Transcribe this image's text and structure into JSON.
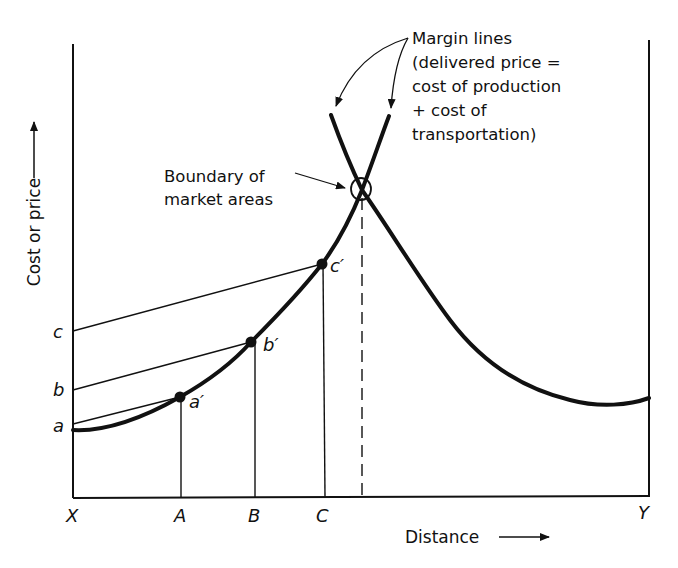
{
  "diagram": {
    "y_axis_label": "Cost or price",
    "x_axis_label": "Distance",
    "x_points": {
      "left_market": "X",
      "right_market": "Y",
      "A": "A",
      "B": "B",
      "C": "C"
    },
    "y_points": {
      "a": "a",
      "b": "b",
      "c": "c"
    },
    "curve_points": {
      "a_prime": "a′",
      "b_prime": "b′",
      "c_prime": "c′"
    },
    "annotations": {
      "boundary": [
        "Boundary of",
        "market areas"
      ],
      "margin_lines": [
        "Margin lines",
        "(delivered price =",
        "cost of production",
        "+ cost of",
        "transportation)"
      ]
    },
    "colors": {
      "ink": "#111111",
      "background": "#ffffff"
    }
  }
}
